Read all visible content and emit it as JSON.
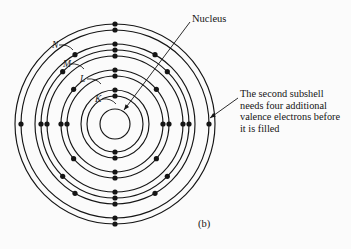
{
  "figure": {
    "caption": "(b)",
    "background_color": "#fbfbfb",
    "ink_color": "#151515"
  },
  "annotations": {
    "nucleus_label": "Nucleus",
    "subshell_note": "The second subshell needs four additional valence electrons before it is filled"
  },
  "shell_labels": [
    {
      "name": "N",
      "text": "N",
      "x": 52,
      "y": 48
    },
    {
      "name": "M",
      "text": "M",
      "x": 63,
      "y": 67
    },
    {
      "name": "L",
      "text": "L",
      "x": 80,
      "y": 82
    },
    {
      "name": "K",
      "text": "K",
      "x": 95,
      "y": 102
    }
  ],
  "chart_data": {
    "type": "diagram",
    "center": {
      "x": 115,
      "y": 124
    },
    "nucleus": {
      "radius": 15,
      "label": "Nucleus"
    },
    "rings": [
      {
        "shell": "K",
        "subshell": 1,
        "radius": 28
      },
      {
        "shell": "K",
        "subshell": 2,
        "radius": 34
      },
      {
        "shell": "L",
        "subshell": 1,
        "radius": 48
      },
      {
        "shell": "L",
        "subshell": 2,
        "radius": 54
      },
      {
        "shell": "M",
        "subshell": 1,
        "radius": 68
      },
      {
        "shell": "M",
        "subshell": 2,
        "radius": 74
      },
      {
        "shell": "M",
        "subshell": 3,
        "radius": 80
      },
      {
        "shell": "N",
        "subshell": 1,
        "radius": 94
      },
      {
        "shell": "N",
        "subshell": 2,
        "radius": 100
      }
    ],
    "electrons": [
      {
        "ring_radius": 28,
        "angles": [
          0,
          180
        ]
      },
      {
        "ring_radius": 34,
        "angles": [
          0,
          180
        ]
      },
      {
        "ring_radius": 48,
        "angles": [
          0,
          90,
          180,
          270
        ]
      },
      {
        "ring_radius": 54,
        "angles": [
          0,
          50,
          90,
          130,
          180,
          230,
          270,
          310
        ]
      },
      {
        "ring_radius": 68,
        "angles": [
          0,
          90,
          180,
          270
        ]
      },
      {
        "ring_radius": 74,
        "angles": [
          0,
          45,
          90,
          135,
          180,
          225,
          270,
          315
        ]
      },
      {
        "ring_radius": 80,
        "angles": [
          0,
          30,
          150,
          180,
          210,
          330
        ]
      },
      {
        "ring_radius": 94,
        "angles": [
          0,
          90,
          180,
          270
        ]
      },
      {
        "ring_radius": 100,
        "angles": [
          0,
          180
        ]
      }
    ],
    "electron_dot_radius": 2.6,
    "leader_lines": [
      {
        "name": "nucleus-leader",
        "from": [
          190,
          22
        ],
        "to": [
          124,
          110
        ]
      },
      {
        "name": "note-leader",
        "from": [
          238,
          98
        ],
        "to": [
          210,
          118
        ]
      }
    ]
  }
}
